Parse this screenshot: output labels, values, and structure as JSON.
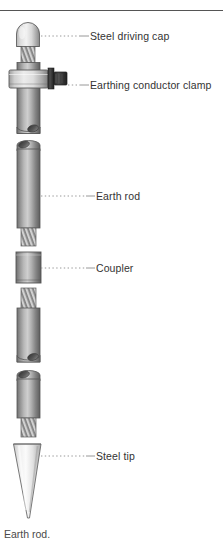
{
  "figure": {
    "caption": "Earth rod.",
    "title_rule": true,
    "labels": [
      {
        "id": "steel-driving-cap",
        "text": "Steel driving cap",
        "x": 90,
        "y": 30,
        "leader_y": 36,
        "leader_from_x": 41,
        "leader_to_x": 88
      },
      {
        "id": "earthing-conductor-clamp",
        "text": "Earthing conductor clamp",
        "x": 90,
        "y": 79,
        "leader_y": 85,
        "leader_from_x": 70,
        "leader_to_x": 88
      },
      {
        "id": "earth-rod",
        "text": "Earth rod",
        "x": 96,
        "y": 190,
        "leader_y": 196,
        "leader_from_x": 41,
        "leader_to_x": 94
      },
      {
        "id": "coupler",
        "text": "Coupler",
        "x": 96,
        "y": 262,
        "leader_y": 268,
        "leader_from_x": 41,
        "leader_to_x": 94
      },
      {
        "id": "steel-tip",
        "text": "Steel tip",
        "x": 96,
        "y": 450,
        "leader_y": 456,
        "leader_from_x": 41,
        "leader_to_x": 94
      }
    ],
    "parts": [
      {
        "id": "steel-driving-cap",
        "name": "Steel driving cap"
      },
      {
        "id": "cap-thread",
        "name": "Cap thread"
      },
      {
        "id": "earthing-conductor-clamp",
        "name": "Earthing conductor clamp"
      },
      {
        "id": "clamp-bolt",
        "name": "Clamp bolt"
      },
      {
        "id": "earth-rod-section-1",
        "name": "Earth rod section 1"
      },
      {
        "id": "earth-rod-section-2",
        "name": "Earth rod section 2"
      },
      {
        "id": "rod-thread-1",
        "name": "Rod thread 1"
      },
      {
        "id": "coupler",
        "name": "Coupler"
      },
      {
        "id": "rod-thread-2",
        "name": "Rod thread 2"
      },
      {
        "id": "earth-rod-section-3",
        "name": "Earth rod section 3"
      },
      {
        "id": "earth-rod-section-4",
        "name": "Earth rod section 4"
      },
      {
        "id": "rod-thread-3",
        "name": "Rod thread 3"
      },
      {
        "id": "steel-tip",
        "name": "Steel tip"
      }
    ],
    "colors": {
      "rule": "#555555",
      "label_text": "#333333",
      "caption_text": "#4a4a4a",
      "leader": "#8c8c8c",
      "metal_light": "#f0f0f0",
      "metal_mid": "#9a9a9a",
      "metal_dark": "#4d4d4d",
      "bolt_dark": "#3b3b3b",
      "tip_light": "#fbfbfb",
      "outline": "#5a5a5a",
      "background": "#ffffff"
    }
  }
}
